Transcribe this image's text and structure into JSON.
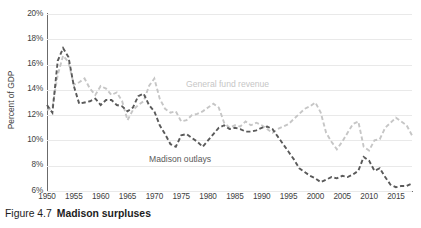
{
  "caption": {
    "number": "Figure 4.7",
    "title": "Madison surpluses"
  },
  "colors": {
    "revenue": "#c6c6c6",
    "outlays": "#5a5a5a",
    "axis": "#6b6b6b",
    "gridline": "#e9e9e9",
    "tick_text": "#3f3f3f",
    "background": "#ffffff"
  },
  "chart_data": {
    "type": "line",
    "title": "",
    "subtitle": "",
    "xlabel": "",
    "ylabel": "Percent of GDP",
    "xlim": [
      1950,
      2018
    ],
    "ylim": [
      6,
      20
    ],
    "grid": true,
    "legend_position": "inline-annotation",
    "y_ticks": [
      "6%",
      "8%",
      "10%",
      "12%",
      "14%",
      "16%",
      "18%",
      "20%"
    ],
    "y_tick_values": [
      6,
      8,
      10,
      12,
      14,
      16,
      18,
      20
    ],
    "x_ticks": [
      "1950",
      "1955",
      "1960",
      "1965",
      "1970",
      "1975",
      "1980",
      "1985",
      "1990",
      "1995",
      "2000",
      "2005",
      "2010",
      "2015"
    ],
    "x_tick_values": [
      1950,
      1955,
      1960,
      1965,
      1970,
      1975,
      1980,
      1985,
      1990,
      1995,
      2000,
      2005,
      2010,
      2015
    ],
    "x": [
      1950,
      1951,
      1952,
      1953,
      1954,
      1955,
      1956,
      1957,
      1958,
      1959,
      1960,
      1961,
      1962,
      1963,
      1964,
      1965,
      1966,
      1967,
      1968,
      1969,
      1970,
      1971,
      1972,
      1973,
      1974,
      1975,
      1976,
      1977,
      1978,
      1979,
      1980,
      1981,
      1982,
      1983,
      1984,
      1985,
      1986,
      1987,
      1988,
      1989,
      1990,
      1991,
      1992,
      1993,
      1994,
      1995,
      1996,
      1997,
      1998,
      1999,
      2000,
      2001,
      2002,
      2003,
      2004,
      2005,
      2006,
      2007,
      2008,
      2009,
      2010,
      2011,
      2012,
      2013,
      2014,
      2015,
      2016,
      2017,
      2018
    ],
    "series": [
      {
        "name": "General fund revenue",
        "color": "#c6c6c6",
        "style": "dashed",
        "label_position": {
          "x": 1983,
          "y": 14.6
        },
        "values": [
          12.4,
          12.6,
          15.2,
          16.7,
          16.2,
          14.4,
          14.6,
          14.9,
          14.1,
          13.6,
          14.3,
          14.1,
          13.6,
          13.8,
          13.1,
          11.6,
          12.4,
          12.8,
          13.1,
          14.3,
          14.9,
          13.3,
          12.5,
          12.2,
          12.3,
          11.5,
          11.6,
          12.0,
          12.1,
          12.3,
          12.6,
          12.9,
          12.6,
          11.4,
          11.0,
          11.2,
          11.1,
          11.5,
          11.2,
          11.4,
          11.2,
          10.9,
          10.6,
          10.9,
          11.1,
          11.3,
          11.7,
          12.1,
          12.5,
          12.7,
          13.0,
          12.2,
          10.6,
          9.9,
          9.3,
          9.9,
          10.6,
          11.3,
          11.5,
          9.5,
          9.2,
          10.0,
          10.1,
          11.0,
          11.4,
          11.8,
          11.5,
          11.2,
          10.4
        ]
      },
      {
        "name": "Madison outlays",
        "color": "#5a5a5a",
        "style": "dashed",
        "label_position": {
          "x": 1977,
          "y": 8.7
        },
        "values": [
          12.8,
          12.2,
          16.3,
          17.3,
          16.6,
          14.3,
          12.9,
          13.0,
          13.1,
          13.3,
          12.8,
          13.2,
          13.2,
          12.8,
          12.7,
          12.3,
          12.6,
          13.5,
          13.7,
          12.8,
          12.3,
          11.2,
          10.5,
          9.7,
          9.5,
          10.4,
          10.5,
          10.2,
          9.9,
          9.5,
          10.0,
          10.5,
          11.0,
          11.2,
          10.9,
          11.0,
          10.9,
          10.7,
          10.7,
          10.8,
          11.0,
          11.1,
          10.9,
          10.3,
          9.7,
          9.1,
          8.5,
          7.8,
          7.5,
          7.2,
          7.0,
          6.7,
          6.9,
          7.1,
          7.0,
          7.2,
          7.1,
          7.3,
          7.6,
          8.7,
          8.4,
          7.6,
          7.8,
          7.1,
          6.5,
          6.3,
          6.4,
          6.4,
          6.6
        ]
      }
    ]
  }
}
